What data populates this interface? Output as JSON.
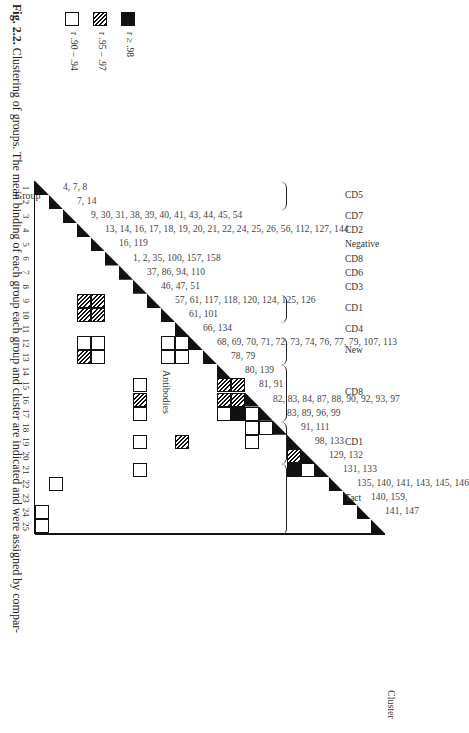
{
  "figure": {
    "header_group": "Group",
    "header_antibodies": "Antibodies",
    "header_cluster": "Cluster"
  },
  "chart_data": {
    "type": "heatmap",
    "title": "Clustering of groups",
    "xlabel": "Group",
    "ylabel": "Group",
    "groups": [
      1,
      2,
      3,
      4,
      5,
      6,
      7,
      8,
      9,
      10,
      11,
      12,
      13,
      14,
      15,
      16,
      17,
      18,
      19,
      20,
      21,
      22,
      23,
      24,
      25
    ],
    "legend": [
      {
        "symbol": "black",
        "label": "r ≥ .98"
      },
      {
        "symbol": "hatched",
        "label": "r .95 – .97"
      },
      {
        "symbol": "open",
        "label": "r .90 – .94"
      }
    ],
    "antibodies_by_group": [
      {
        "group": 1,
        "antibodies": "4, 7, 8"
      },
      {
        "group": 2,
        "antibodies": "7, 14"
      },
      {
        "group": 3,
        "antibodies": "9, 30, 31, 38, 39, 40, 41, 43, 44, 45, 54"
      },
      {
        "group": 4,
        "antibodies": "13, 14, 16, 17, 18, 19, 20, 21, 22, 24, 25, 26, 56, 112, 127, 144"
      },
      {
        "group": 5,
        "antibodies": "16, 119"
      },
      {
        "group": 6,
        "antibodies": "1, 2,      35, 100,      157, 158"
      },
      {
        "group": 7,
        "antibodies": "37, 86, 94, 110"
      },
      {
        "group": 8,
        "antibodies": "46, 47, 51"
      },
      {
        "group": 9,
        "antibodies": "57, 61, 117, 118, 120, 124, 125, 126"
      },
      {
        "group": 10,
        "antibodies": "61, 101"
      },
      {
        "group": 11,
        "antibodies": "66, 134"
      },
      {
        "group": 12,
        "antibodies": "68, 69, 70, 71, 72, 73, 74, 76, 77, 79, 107, 113"
      },
      {
        "group": 13,
        "antibodies": "78, 79"
      },
      {
        "group": 14,
        "antibodies": "80, 139"
      },
      {
        "group": 15,
        "antibodies": "81, 91"
      },
      {
        "group": 16,
        "antibodies": "82, 83, 84, 87, 88, 90, 92, 93, 97"
      },
      {
        "group": 17,
        "antibodies": "83, 89, 96, 99"
      },
      {
        "group": 18,
        "antibodies": "91, 111"
      },
      {
        "group": 19,
        "antibodies": "98, 133"
      },
      {
        "group": 20,
        "antibodies": "129, 132"
      },
      {
        "group": 21,
        "antibodies": "131, 133"
      },
      {
        "group": 22,
        "antibodies": "135, 140, 141, 143, 145, 146"
      },
      {
        "group": 23,
        "antibodies": "140, 159,"
      },
      {
        "group": 24,
        "antibodies": "141, 147"
      },
      {
        "group": 25,
        "antibodies": ""
      }
    ],
    "clusters": [
      {
        "label": "CD5",
        "groups": [
          1,
          2
        ]
      },
      {
        "label": "CD7",
        "groups": [
          3
        ]
      },
      {
        "label": "CD2",
        "groups": [
          4
        ]
      },
      {
        "label": "Negative",
        "groups": [
          5
        ]
      },
      {
        "label": "CD8",
        "groups": [
          6
        ]
      },
      {
        "label": "CD6",
        "groups": [
          7
        ]
      },
      {
        "label": "CD3",
        "groups": [
          8
        ]
      },
      {
        "label": "CD1",
        "groups": [
          9,
          10
        ]
      },
      {
        "label": "CD4",
        "groups": [
          11
        ]
      },
      {
        "label": "New",
        "groups": [
          12,
          13
        ]
      },
      {
        "label": "CD8",
        "groups": [
          14,
          15,
          16,
          17
        ]
      },
      {
        "label": "CD1",
        "groups": [
          18,
          19,
          20
        ]
      },
      {
        "label": "Tact",
        "groups": [
          21,
          22,
          23,
          24,
          25
        ]
      }
    ],
    "off_diagonal_cells": [
      {
        "row": 3,
        "col": 9,
        "r": "hatched"
      },
      {
        "row": 3,
        "col": 10,
        "r": "hatched"
      },
      {
        "row": 4,
        "col": 9,
        "r": "hatched"
      },
      {
        "row": 4,
        "col": 10,
        "r": "hatched"
      },
      {
        "row": 3,
        "col": 12,
        "r": "open"
      },
      {
        "row": 3,
        "col": 13,
        "r": "hatched"
      },
      {
        "row": 4,
        "col": 12,
        "r": "open"
      },
      {
        "row": 4,
        "col": 13,
        "r": "open"
      },
      {
        "row": 9,
        "col": 12,
        "r": "open"
      },
      {
        "row": 9,
        "col": 13,
        "r": "open"
      },
      {
        "row": 10,
        "col": 12,
        "r": "open"
      },
      {
        "row": 10,
        "col": 13,
        "r": "open"
      },
      {
        "row": 7,
        "col": 15,
        "r": "open"
      },
      {
        "row": 7,
        "col": 16,
        "r": "hatched"
      },
      {
        "row": 7,
        "col": 17,
        "r": "open"
      },
      {
        "row": 7,
        "col": 19,
        "r": "open"
      },
      {
        "row": 7,
        "col": 21,
        "r": "open"
      },
      {
        "row": 10,
        "col": 19,
        "r": "hatched"
      },
      {
        "row": 13,
        "col": 15,
        "r": "hatched"
      },
      {
        "row": 13,
        "col": 16,
        "r": "hatched"
      },
      {
        "row": 14,
        "col": 15,
        "r": "hatched"
      },
      {
        "row": 14,
        "col": 16,
        "r": "hatched"
      },
      {
        "row": 14,
        "col": 17,
        "r": "black"
      },
      {
        "row": 13,
        "col": 17,
        "r": "open"
      },
      {
        "row": 15,
        "col": 17,
        "r": "open"
      },
      {
        "row": 15,
        "col": 18,
        "r": "open"
      },
      {
        "row": 15,
        "col": 19,
        "r": "open"
      },
      {
        "row": 16,
        "col": 18,
        "r": "open"
      },
      {
        "row": 18,
        "col": 20,
        "r": "hatched"
      },
      {
        "row": 18,
        "col": 21,
        "r": "black"
      },
      {
        "row": 19,
        "col": 21,
        "r": "open"
      },
      {
        "row": 1,
        "col": 22,
        "r": "open"
      },
      {
        "row": 0,
        "col": 24,
        "r": "open"
      },
      {
        "row": 0,
        "col": 25,
        "r": "open"
      }
    ]
  },
  "legend": {
    "items": [
      {
        "symbol": "black",
        "label": "r ≥ .98"
      },
      {
        "symbol": "hatched",
        "label": "r .95 – .97"
      },
      {
        "symbol": "open",
        "label": "r .90 – .94"
      }
    ]
  },
  "caption": {
    "label": "Fig. 2.2.",
    "text": " Clustering of groups. The mean binding of each group    each group and cluster are indicated and were assigned by compar-"
  }
}
